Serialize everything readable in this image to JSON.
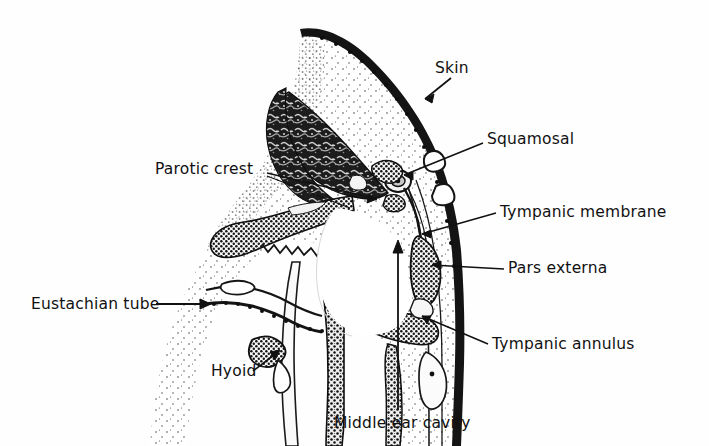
{
  "figure": {
    "kind": "anatomical-cross-section",
    "background_color": "#fefefe",
    "ink_color": "#111111"
  },
  "labels": [
    {
      "id": "skin",
      "text": "Skin",
      "leader": "arrow",
      "x": 435,
      "y": 59
    },
    {
      "id": "squamosal",
      "text": "Squamosal",
      "leader": "line",
      "x": 487,
      "y": 130
    },
    {
      "id": "parotic_crest",
      "text": "Parotic crest",
      "leader": "line",
      "x": 155,
      "y": 160
    },
    {
      "id": "tympanic_membrane",
      "text": "Tympanic membrane",
      "leader": "arrow",
      "x": 500,
      "y": 203
    },
    {
      "id": "pars_externa",
      "text": "Pars externa",
      "leader": "arrow",
      "x": 508,
      "y": 259
    },
    {
      "id": "tympanic_annulus",
      "text": "Tympanic annulus",
      "leader": "arrow",
      "x": 492,
      "y": 335
    },
    {
      "id": "eustachian_tube",
      "text": "Eustachian tube",
      "leader": "arrow",
      "x": 31,
      "y": 295
    },
    {
      "id": "hyoid",
      "text": "Hyoid",
      "leader": "arrow",
      "x": 211,
      "y": 362
    },
    {
      "id": "middle_ear_cavity",
      "text": "Middle ear cavity",
      "leader": "arrow",
      "x": 334,
      "y": 414
    }
  ],
  "label_text": {
    "skin": "Skin",
    "squamosal": "Squamosal",
    "parotic_crest": "Parotic crest",
    "tympanic_membrane": "Tympanic membrane",
    "pars_externa": "Pars externa",
    "tympanic_annulus": "Tympanic annulus",
    "eustachian_tube": "Eustachian tube",
    "hyoid": "Hyoid",
    "middle_ear_cavity": "Middle ear cavity"
  },
  "structures": [
    {
      "id": "skin_layer",
      "name": "skin layer",
      "fill": "dark-stipple",
      "note": "thin dark band along outer convex margin, upper right"
    },
    {
      "id": "soft_tissue",
      "name": "subcutaneous soft tissue",
      "fill": "light-stipple",
      "note": "pale sparsely stippled field filling most of section"
    },
    {
      "id": "squamosal_bone",
      "name": "squamosal bone mass",
      "fill": "mottled-dark",
      "note": "large dark trabecular wedge, upper centre"
    },
    {
      "id": "parotic_crest_bone",
      "name": "parotic crest",
      "fill": "coarse-stipple",
      "note": "curved beaded bone sweeping left from centre"
    },
    {
      "id": "ossicles",
      "name": "ear ossicles",
      "fill": "ring-outline",
      "note": "small concentric ring bodies at centre"
    },
    {
      "id": "tympanic_membrane_line",
      "name": "tympanic membrane",
      "fill": "thin-line",
      "note": "thin membrane arc on right of cavity"
    },
    {
      "id": "pars_externa_bone",
      "name": "pars externa",
      "fill": "coarse-stipple",
      "note": "dark beaded mass right of middle ear cavity"
    },
    {
      "id": "tympanic_annulus_bone",
      "name": "tympanic annulus",
      "fill": "coarse-stipple",
      "note": "dark beaded band crossing below the cavity"
    },
    {
      "id": "middle_ear_cavity_space",
      "name": "middle ear cavity",
      "fill": "white",
      "note": "open white space at centre of section"
    },
    {
      "id": "eustachian_tube_lumen",
      "name": "eustachian tube lumen",
      "fill": "white-outline",
      "note": "elongated lumen at left, entered by arrow"
    },
    {
      "id": "hyoid_bone",
      "name": "hyoid",
      "fill": "coarse-stipple",
      "note": "small dark oval, lower left"
    },
    {
      "id": "descending_processes",
      "name": "descending bony processes",
      "fill": "coarse-stipple",
      "note": "two elongated beaded columns descending to lower edge"
    }
  ]
}
